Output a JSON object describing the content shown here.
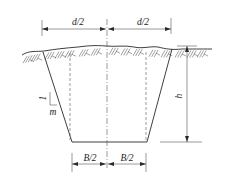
{
  "diagram": {
    "title": "",
    "type": "trench cross-section",
    "labels": {
      "top_left_width": "d/2",
      "top_right_width": "d/2",
      "depth": "h",
      "bottom_left_width": "B/2",
      "bottom_right_width": "B/2",
      "slope_rise": "1",
      "slope_run": "m"
    },
    "elements": [
      "ground-surface",
      "soil-hatching",
      "trench-profile",
      "center-line",
      "bottom-edge-projections",
      "depth-dimension",
      "top-width-dimension",
      "bottom-width-dimension",
      "slope-indicator"
    ]
  }
}
